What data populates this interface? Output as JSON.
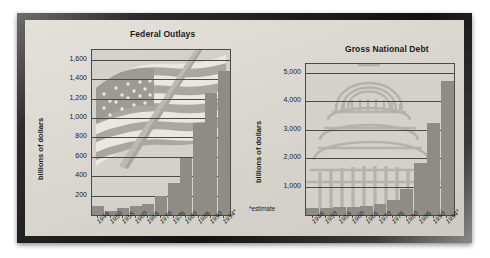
{
  "figure": {
    "background_color": "#d9d7cf",
    "frame_color": "#1b1b1b",
    "bar_color": "#8e8c85",
    "axis_color": "#4a4a4a"
  },
  "charts": [
    {
      "id": "federal-outlays",
      "title": "Federal Outlays",
      "ylabel": "billions of dollars",
      "watermark": "american-flag",
      "note": "",
      "chart_data": {
        "type": "bar",
        "title": "Federal Outlays",
        "xlabel": "",
        "ylabel": "billions of dollars",
        "ylim": [
          0,
          1700
        ],
        "yticks": [
          200,
          400,
          600,
          800,
          1000,
          1200,
          1400,
          1600
        ],
        "ytick_labels": [
          "200",
          "400",
          "600",
          "800",
          "1,000",
          "1,200",
          "1,400",
          "1,600"
        ],
        "grid": true,
        "legend": "none",
        "categories": [
          "1945",
          "1950",
          "1955",
          "1960",
          "1965",
          "1970",
          "1975",
          "1980",
          "1985",
          "1990",
          "1994*"
        ],
        "values": [
          93,
          43,
          68,
          92,
          118,
          196,
          332,
          591,
          946,
          1253,
          1484
        ]
      }
    },
    {
      "id": "gross-national-debt",
      "title": "Gross National Debt",
      "ylabel": "billions of dollars",
      "watermark": "us-capitol",
      "note": "*estimate",
      "chart_data": {
        "type": "bar",
        "title": "Gross National Debt",
        "xlabel": "",
        "ylabel": "billions of dollars",
        "ylim": [
          0,
          5300
        ],
        "yticks": [
          1000,
          2000,
          3000,
          4000,
          5000
        ],
        "ytick_labels": [
          "1,000",
          "2,000",
          "3,000",
          "4,000",
          "5,000"
        ],
        "grid": true,
        "legend": "none",
        "categories": [
          "1945",
          "1950",
          "1955",
          "1960",
          "1965",
          "1970",
          "1975",
          "1980",
          "1985",
          "1990",
          "1994*"
        ],
        "values": [
          260,
          257,
          274,
          291,
          323,
          381,
          542,
          909,
          1817,
          3233,
          4692
        ]
      }
    }
  ]
}
